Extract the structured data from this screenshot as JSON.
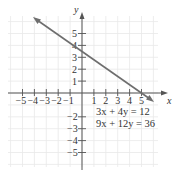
{
  "figure": {
    "x_axis_label": "x",
    "y_axis_label": "y",
    "x_tick_labels": [
      "−5",
      "−4",
      "−3",
      "−2",
      "−1",
      "1",
      "2",
      "3",
      "4",
      "5"
    ],
    "y_tick_labels": [
      "5",
      "4",
      "3",
      "2",
      "1",
      "−2",
      "−3",
      "−4",
      "−5"
    ],
    "equations": [
      "3x + 4y = 12",
      "9x + 12y = 36"
    ],
    "colors": {
      "grid": "#e6e6e6",
      "axis": "#555555",
      "line": "#6e6e6e",
      "text": "#333333"
    }
  },
  "chart_data": {
    "type": "line",
    "title": "",
    "xlabel": "x",
    "ylabel": "y",
    "xlim": [
      -6,
      6
    ],
    "ylim": [
      -6,
      6
    ],
    "grid": true,
    "series": [
      {
        "name": "3x + 4y = 12 (same as 9x + 12y = 36)",
        "x": [
          -4,
          0,
          4,
          6
        ],
        "y": [
          6,
          3,
          0,
          -1.5
        ]
      }
    ],
    "annotations": [
      "3x + 4y = 12",
      "9x + 12y = 36"
    ]
  }
}
